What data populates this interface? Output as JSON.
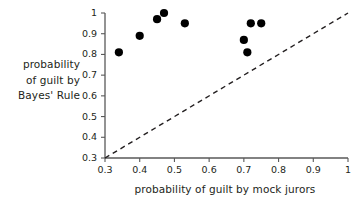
{
  "chart_data": {
    "type": "scatter",
    "title": "",
    "xlabel": "probability of guilt by mock jurors",
    "ylabel": "probability of guilt by Bayes' Rule",
    "ylabel_lines": [
      "probability",
      "of guilt by",
      "Bayes' Rule"
    ],
    "xlim": [
      0.3,
      1
    ],
    "ylim": [
      0.3,
      1
    ],
    "xticks": [
      "0.3",
      "0.4",
      "0.5",
      "0.6",
      "0.7",
      "0.8",
      "0.9",
      "1"
    ],
    "yticks": [
      "0.3",
      "0.4",
      "0.5",
      "0.6",
      "0.7",
      "0.8",
      "0.9",
      "1"
    ],
    "xtick_values": [
      0.3,
      0.4,
      0.5,
      0.6,
      0.7,
      0.8,
      0.9,
      1
    ],
    "ytick_values": [
      0.3,
      0.4,
      0.5,
      0.6,
      0.7,
      0.8,
      0.9,
      1
    ],
    "grid": false,
    "legend": false,
    "marker_color": "#000000",
    "axis_color": "#595959",
    "points": [
      {
        "x": 0.34,
        "y": 0.81
      },
      {
        "x": 0.4,
        "y": 0.89
      },
      {
        "x": 0.45,
        "y": 0.97
      },
      {
        "x": 0.47,
        "y": 1.0
      },
      {
        "x": 0.53,
        "y": 0.95
      },
      {
        "x": 0.7,
        "y": 0.87
      },
      {
        "x": 0.71,
        "y": 0.81
      },
      {
        "x": 0.72,
        "y": 0.95
      },
      {
        "x": 0.75,
        "y": 0.95
      }
    ],
    "reference_line": {
      "name": "identity-line",
      "style": "dashed",
      "from": [
        0.3,
        0.3
      ],
      "to": [
        1.0,
        1.0
      ],
      "color": "#231f20"
    }
  }
}
